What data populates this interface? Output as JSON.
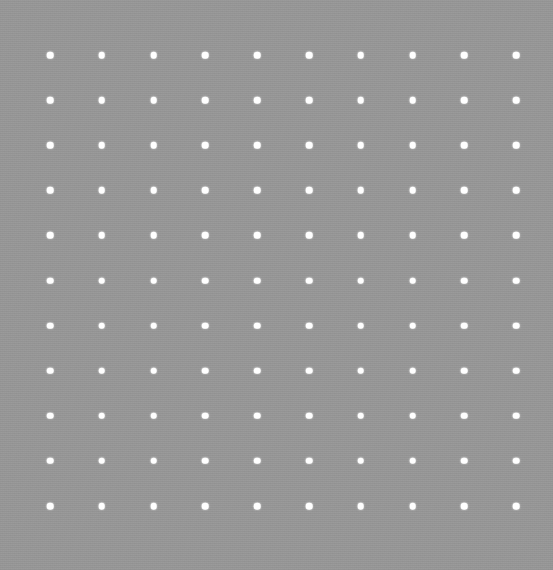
{
  "canvas": {
    "name": "dot-grid-canvas",
    "width": 553,
    "height": 570,
    "background_color": "#969696",
    "dot_color": "#ffffff",
    "dot_diameter_px": 6.6
  },
  "grid": {
    "columns": 10,
    "rows": 11,
    "total_dots": 110,
    "origin_x": 50,
    "origin_y": 55,
    "spacing_x": 51.8,
    "spacing_y": 45.1,
    "margin_left": 50,
    "margin_right": 37,
    "margin_top": 55,
    "margin_bottom": 64,
    "column_centers_x": [
      50,
      101.8,
      153.6,
      205.4,
      257.2,
      309.0,
      360.8,
      412.6,
      464.4,
      516.2
    ],
    "row_centers_y": [
      55,
      100.1,
      145.2,
      190.3,
      235.4,
      280.5,
      325.6,
      370.7,
      415.8,
      460.9,
      506.0
    ]
  }
}
